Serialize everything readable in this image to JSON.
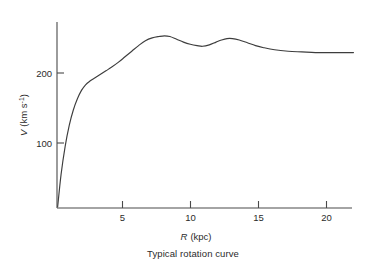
{
  "figure": {
    "caption": "Typical rotation curve",
    "background_color": "#ffffff",
    "line_color": "#3d3d3d",
    "axis_color": "#4a4a4a"
  },
  "chart_data": {
    "type": "line",
    "title": "Typical rotation curve",
    "xlabel": "R (kpc)",
    "xlabel_symbol": "R",
    "xlabel_unit": "(kpc)",
    "ylabel": "V (km s-1)",
    "ylabel_symbol": "V",
    "ylabel_unit": "(km s",
    "ylabel_exponent": "-1",
    "ylabel_unit_close": ")",
    "xlim": [
      0,
      22.5
    ],
    "ylim": [
      0,
      270
    ],
    "xticks": [
      5,
      10,
      15,
      20
    ],
    "xticklabels": [
      "5",
      "10",
      "15",
      "20"
    ],
    "yticks": [
      100,
      200
    ],
    "yticklabels": [
      "100",
      "200"
    ],
    "grid": false,
    "legend": false,
    "series": [
      {
        "name": "rotation curve",
        "x": [
          0.05,
          0.3,
          0.6,
          0.9,
          1.2,
          1.5,
          1.8,
          2.1,
          2.4,
          2.8,
          3.2,
          3.6,
          4.0,
          4.5,
          5.0,
          5.5,
          6.0,
          6.5,
          7.0,
          7.5,
          7.9,
          8.3,
          8.8,
          9.3,
          9.8,
          10.3,
          10.7,
          11.2,
          11.7,
          12.1,
          12.5,
          12.9,
          13.4,
          14.0,
          14.6,
          15.2,
          16.0,
          17.0,
          18.0,
          19.0,
          20.0,
          21.0,
          21.8
        ],
        "y": [
          2,
          48,
          88,
          118,
          140,
          156,
          168,
          176,
          181,
          186,
          191,
          196,
          201,
          208,
          216,
          224,
          232,
          239,
          243,
          245,
          246,
          245,
          241,
          237,
          234,
          232,
          231,
          233,
          237,
          240,
          242,
          242,
          240,
          236,
          232,
          229,
          226,
          224,
          223,
          222,
          222,
          222,
          222
        ]
      }
    ]
  },
  "axes_geometry": {
    "origin_x": 57,
    "origin_y": 208,
    "x_right": 352,
    "y_top": 22,
    "px_per_kpc": 13.6,
    "px_per_100kms": 70
  }
}
